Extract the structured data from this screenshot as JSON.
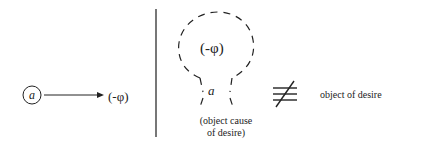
{
  "diagram": {
    "left_panel": {
      "node": {
        "label": "a",
        "shape": "circle"
      },
      "arrow": {
        "direction": "right"
      },
      "target": {
        "label": "(-φ)"
      }
    },
    "divider": {
      "orientation": "vertical",
      "color": "#444444"
    },
    "right_panel": {
      "dashed_shape": {
        "inner_label": "(-φ)",
        "neck_label": "a",
        "style": "dashed"
      },
      "caption": {
        "line1": "(object cause",
        "line2": "of desire)"
      },
      "relation_symbol": {
        "name": "not-equivalent-icon",
        "glyph": "≢"
      },
      "comparison_label": "object of desire"
    },
    "colors": {
      "stroke": "#222222",
      "background": "#ffffff"
    }
  }
}
